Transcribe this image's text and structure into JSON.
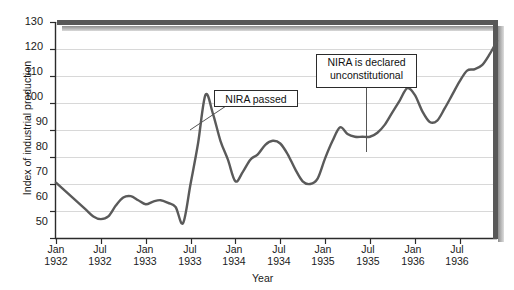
{
  "chart_data": {
    "type": "line",
    "title": "",
    "xlabel": "Year",
    "ylabel": "Index of industrial production",
    "ylim": [
      50,
      130
    ],
    "yticks": [
      50,
      60,
      70,
      80,
      90,
      100,
      110,
      120,
      130
    ],
    "grid": true,
    "legend": "none",
    "xtick_labels": [
      {
        "month": "Jan",
        "year": "1932"
      },
      {
        "month": "Jul",
        "year": "1932"
      },
      {
        "month": "Jan",
        "year": "1933"
      },
      {
        "month": "Jul",
        "year": "1933"
      },
      {
        "month": "Jan",
        "year": "1934"
      },
      {
        "month": "Jul",
        "year": "1934"
      },
      {
        "month": "Jan",
        "year": "1935"
      },
      {
        "month": "Jul",
        "year": "1935"
      },
      {
        "month": "Jan",
        "year": "1936"
      },
      {
        "month": "Jul",
        "year": "1936"
      }
    ],
    "x": [
      "1932-01",
      "1932-02",
      "1932-03",
      "1932-04",
      "1932-05",
      "1932-06",
      "1932-07",
      "1932-08",
      "1932-09",
      "1932-10",
      "1932-11",
      "1932-12",
      "1933-01",
      "1933-02",
      "1933-03",
      "1933-04",
      "1933-05",
      "1933-06",
      "1933-07",
      "1933-08",
      "1933-09",
      "1933-10",
      "1933-11",
      "1933-12",
      "1934-01",
      "1934-02",
      "1934-03",
      "1934-04",
      "1934-05",
      "1934-06",
      "1934-07",
      "1934-08",
      "1934-09",
      "1934-10",
      "1934-11",
      "1934-12",
      "1935-01",
      "1935-02",
      "1935-03",
      "1935-04",
      "1935-05",
      "1935-06",
      "1935-07",
      "1935-08",
      "1935-09",
      "1935-10",
      "1935-11",
      "1935-12",
      "1936-01",
      "1936-02",
      "1936-03",
      "1936-04",
      "1936-05",
      "1936-06",
      "1936-07",
      "1936-08",
      "1936-09",
      "1936-10",
      "1936-11",
      "1936-12"
    ],
    "values": [
      70.5,
      68.0,
      65.5,
      63.0,
      60.5,
      58.0,
      57.0,
      58.0,
      62.0,
      65.0,
      65.5,
      64.0,
      62.5,
      63.5,
      64.0,
      63.0,
      61.5,
      55.5,
      70.0,
      85.0,
      103.0,
      96.0,
      86.0,
      79.0,
      71.0,
      74.5,
      79.0,
      81.0,
      84.5,
      86.0,
      85.0,
      81.0,
      75.5,
      71.0,
      70.0,
      72.0,
      79.5,
      86.0,
      91.0,
      88.5,
      87.5,
      87.5,
      87.5,
      89.0,
      92.0,
      96.5,
      101.0,
      105.5,
      103.0,
      97.0,
      93.0,
      93.5,
      98.0,
      103.0,
      108.0,
      112.0,
      112.5,
      114.0,
      118.0,
      123.0
    ],
    "annotations": [
      {
        "id": "nira-passed",
        "text": "NIRA passed",
        "target_x": "1933-08",
        "target_y": 90.0
      },
      {
        "id": "nira-unconstitutional",
        "text": "NIRA is declared\nunconstitutional",
        "target_x": "1935-07",
        "target_y": 87.5
      }
    ],
    "colors": {
      "line": "#5a5a5a",
      "grid": "#d8d8d8",
      "axis": "#2b2b2b",
      "frame_top": "#555555",
      "frame_right": "#555555",
      "background": "#ffffff",
      "annotation_border": "#2b2b2b",
      "annotation_background": "#ffffff"
    }
  }
}
